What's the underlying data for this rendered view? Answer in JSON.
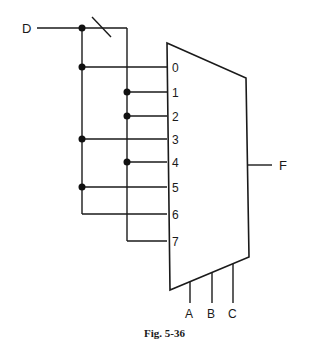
{
  "diagram": {
    "type": "multiplexer-circuit",
    "input_signal": "D",
    "output_signal": "F",
    "data_inputs": [
      "0",
      "1",
      "2",
      "3",
      "4",
      "5",
      "6",
      "7"
    ],
    "select_inputs": [
      "A",
      "B",
      "C"
    ],
    "connections": {
      "D": [
        "0",
        "3",
        "5"
      ],
      "D_inverted": [
        "1",
        "2",
        "4",
        "7"
      ],
      "line6": "D"
    },
    "caption": "Fig. 5-36"
  }
}
